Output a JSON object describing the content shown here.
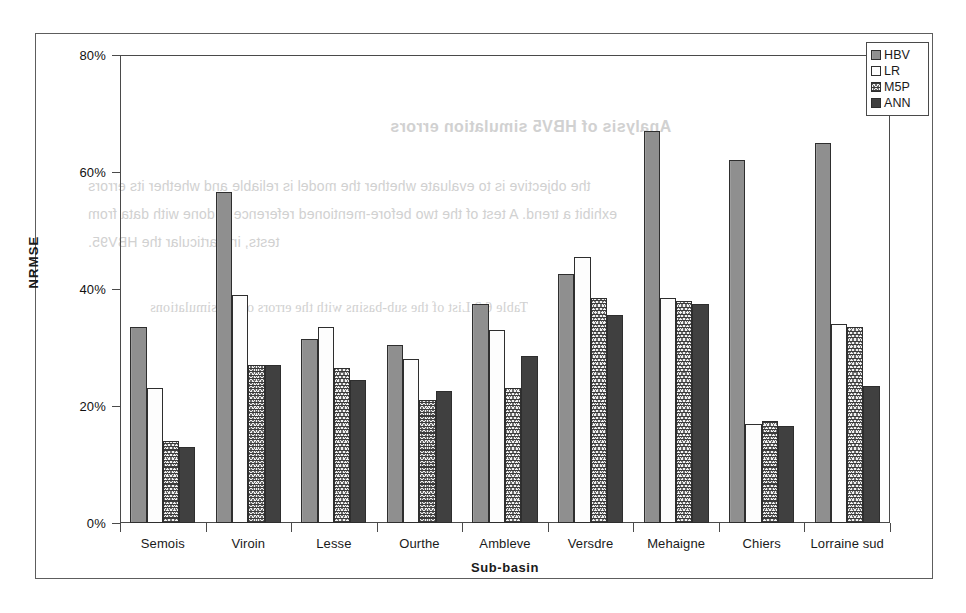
{
  "figure": {
    "frame": true
  },
  "legend": {
    "position": "top-right",
    "entries": [
      {
        "label": "HBV",
        "swatch": "hbv-swatch"
      },
      {
        "label": "LR",
        "swatch": "lr-swatch"
      },
      {
        "label": "M5P",
        "swatch": "m5p-swatch"
      },
      {
        "label": "ANN",
        "swatch": "ann-swatch"
      }
    ]
  },
  "axes": {
    "y_title": "NRMSE",
    "x_title": "Sub-basin",
    "y_ticks": [
      "0%",
      "20%",
      "40%",
      "60%",
      "80%"
    ]
  },
  "colors": {
    "hbv": "#8f8f8f",
    "lr": "#fdfdfd",
    "m5p": "#f2f2f2",
    "ann": "#404040",
    "axis": "#4a4a4a",
    "frame": "#5d5d5d",
    "bleed": "#c9c9c9"
  },
  "scan_bleed": {
    "heading": "Analysis of HBV5 simulation errors",
    "lines": [
      "the objective is to evaluate whether the model is reliable and whether its errors",
      "exhibit a trend. A test of the two before-mentioned reference is done with data from",
      "tests, in particular the HBV95.",
      "Table 6.2 List of the sub-basins with the errors of the simulations"
    ]
  },
  "chart_data": {
    "type": "bar",
    "title": "",
    "xlabel": "Sub-basin",
    "ylabel": "NRMSE",
    "ylim": [
      0,
      80
    ],
    "ytick_values": [
      0,
      20,
      40,
      60,
      80
    ],
    "ytick_labels": [
      "0%",
      "20%",
      "40%",
      "60%",
      "80%"
    ],
    "grid": false,
    "legend_position": "upper right",
    "units": "percent",
    "categories": [
      "Semois",
      "Viroin",
      "Lesse",
      "Ourthe",
      "Ambleve",
      "Versdre",
      "Mehaigne",
      "Chiers",
      "Lorraine sud"
    ],
    "series": [
      {
        "name": "HBV",
        "values": [
          33.5,
          56.5,
          31.5,
          30.5,
          37.5,
          42.5,
          67.0,
          62.0,
          65.0
        ]
      },
      {
        "name": "LR",
        "values": [
          23.0,
          39.0,
          33.5,
          28.0,
          33.0,
          45.5,
          38.5,
          17.0,
          34.0
        ]
      },
      {
        "name": "M5P",
        "values": [
          14.0,
          27.0,
          26.5,
          21.0,
          23.0,
          38.5,
          38.0,
          17.5,
          33.5
        ]
      },
      {
        "name": "ANN",
        "values": [
          13.0,
          27.0,
          24.5,
          22.5,
          28.5,
          35.5,
          37.5,
          16.5,
          23.5
        ]
      }
    ]
  }
}
